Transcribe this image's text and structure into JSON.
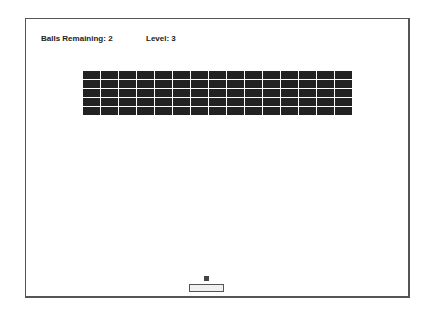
{
  "hud": {
    "balls_label": "Balls Remaining: 2",
    "balls_remaining": 2,
    "level_label": "Level: 3",
    "level": 3
  },
  "bricks": {
    "rows": 5,
    "columns": 15,
    "color": "#222222"
  },
  "colors": {
    "background": "#ffffff",
    "border": "#555555",
    "ball": "#444444",
    "paddle_fill": "#f0f0f0"
  }
}
